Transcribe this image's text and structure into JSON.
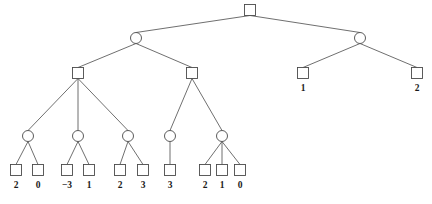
{
  "figure": {
    "kind": "game-tree",
    "stroke_color": "#4a4a4a",
    "text_color": "#1a1a1a",
    "background_color": "#ffffff"
  },
  "chart_data": {
    "type": "diagram",
    "title": "",
    "nodes": [
      {
        "id": "root",
        "shape": "square",
        "x": 250,
        "y": 10,
        "label": ""
      },
      {
        "id": "n-l",
        "shape": "circle",
        "x": 136,
        "y": 38,
        "label": ""
      },
      {
        "id": "n-r",
        "shape": "circle",
        "x": 360,
        "y": 38,
        "label": ""
      },
      {
        "id": "n-ll",
        "shape": "square",
        "x": 78,
        "y": 73,
        "label": ""
      },
      {
        "id": "n-lr",
        "shape": "square",
        "x": 192,
        "y": 73,
        "label": ""
      },
      {
        "id": "n-rl",
        "shape": "square",
        "x": 303,
        "y": 73,
        "label": "1"
      },
      {
        "id": "n-rr",
        "shape": "square",
        "x": 417,
        "y": 73,
        "label": "2"
      },
      {
        "id": "c1",
        "shape": "circle",
        "x": 28,
        "y": 136,
        "label": ""
      },
      {
        "id": "c2",
        "shape": "circle",
        "x": 78,
        "y": 136,
        "label": ""
      },
      {
        "id": "c3",
        "shape": "circle",
        "x": 128,
        "y": 136,
        "label": ""
      },
      {
        "id": "c4",
        "shape": "circle",
        "x": 170,
        "y": 136,
        "label": ""
      },
      {
        "id": "c5",
        "shape": "circle",
        "x": 222,
        "y": 136,
        "label": ""
      },
      {
        "id": "f1",
        "shape": "square",
        "x": 16,
        "y": 170,
        "label": "2"
      },
      {
        "id": "f2",
        "shape": "square",
        "x": 38,
        "y": 170,
        "label": "0"
      },
      {
        "id": "f3",
        "shape": "square",
        "x": 67,
        "y": 170,
        "label": "−3"
      },
      {
        "id": "f4",
        "shape": "square",
        "x": 89,
        "y": 170,
        "label": "1"
      },
      {
        "id": "f5",
        "shape": "square",
        "x": 120,
        "y": 170,
        "label": "2"
      },
      {
        "id": "f6",
        "shape": "square",
        "x": 143,
        "y": 170,
        "label": "3"
      },
      {
        "id": "f7",
        "shape": "square",
        "x": 170,
        "y": 170,
        "label": "3"
      },
      {
        "id": "f8",
        "shape": "square",
        "x": 205,
        "y": 170,
        "label": "2"
      },
      {
        "id": "f9",
        "shape": "square",
        "x": 222,
        "y": 170,
        "label": "1"
      },
      {
        "id": "f10",
        "shape": "square",
        "x": 240,
        "y": 170,
        "label": "0"
      }
    ],
    "edges": [
      {
        "from": "root",
        "to": "n-l"
      },
      {
        "from": "root",
        "to": "n-r"
      },
      {
        "from": "n-l",
        "to": "n-ll"
      },
      {
        "from": "n-l",
        "to": "n-lr"
      },
      {
        "from": "n-r",
        "to": "n-rl"
      },
      {
        "from": "n-r",
        "to": "n-rr"
      },
      {
        "from": "n-ll",
        "to": "c1"
      },
      {
        "from": "n-ll",
        "to": "c2"
      },
      {
        "from": "n-ll",
        "to": "c3"
      },
      {
        "from": "n-lr",
        "to": "c4"
      },
      {
        "from": "n-lr",
        "to": "c5"
      },
      {
        "from": "c1",
        "to": "f1"
      },
      {
        "from": "c1",
        "to": "f2"
      },
      {
        "from": "c2",
        "to": "f3"
      },
      {
        "from": "c2",
        "to": "f4"
      },
      {
        "from": "c3",
        "to": "f5"
      },
      {
        "from": "c3",
        "to": "f6"
      },
      {
        "from": "c4",
        "to": "f7"
      },
      {
        "from": "c5",
        "to": "f8"
      },
      {
        "from": "c5",
        "to": "f9"
      },
      {
        "from": "c5",
        "to": "f10"
      }
    ],
    "leaf_values": [
      "2",
      "0",
      "−3",
      "1",
      "2",
      "3",
      "3",
      "2",
      "1",
      "0",
      "1",
      "2"
    ],
    "square_size": 11,
    "circle_radius": 5.5,
    "label_offset_y": 18
  }
}
